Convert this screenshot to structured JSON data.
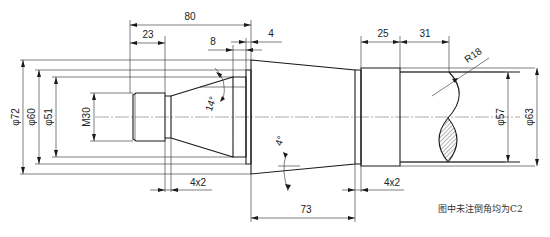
{
  "drawing": {
    "title": "Shaft part drawing",
    "note": "图中未注倒角均为C2"
  },
  "dimensions": {
    "horizontal": {
      "d80": "80",
      "d23": "23",
      "d8": "8",
      "d4": "4",
      "d25": "25",
      "d31": "31",
      "d73": "73",
      "groove_left": "4x2",
      "groove_right": "4x2"
    },
    "diameters": {
      "phi72": "φ72",
      "phi60": "φ60",
      "phi51": "φ51",
      "m30": "M30",
      "phi57": "φ57",
      "phi63": "φ63"
    },
    "angles": {
      "a14": "14°",
      "a4": "4°"
    },
    "radius": {
      "r18": "R18"
    }
  }
}
